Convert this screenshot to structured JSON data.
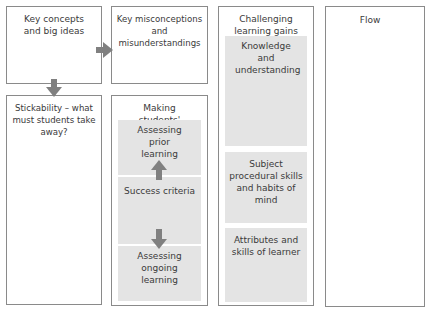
{
  "diagram": {
    "boxes": {
      "key_concepts": {
        "title": "Key concepts and big ideas"
      },
      "key_misconceptions": {
        "title": "Key misconceptions and misunderstandings"
      },
      "challenging_gains": {
        "title": "Challenging learning gains",
        "sections": [
          {
            "label": "Knowledge and understanding"
          },
          {
            "label": "Subject procedural skills and habits of mind"
          },
          {
            "label": "Attributes and skills of learner"
          }
        ]
      },
      "flow": {
        "title": "Flow"
      },
      "stickability": {
        "title": "Stickability – what must students take away?"
      },
      "learning_visible": {
        "title": "Making students' learning visible",
        "sections": [
          {
            "label": "Assessing prior learning"
          },
          {
            "label": "Success criteria"
          },
          {
            "label": "Assessing ongoing learning"
          }
        ]
      }
    },
    "arrows": [
      {
        "from": "key_concepts",
        "to": "key_misconceptions",
        "direction": "right"
      },
      {
        "from": "key_concepts",
        "to": "stickability",
        "direction": "down"
      },
      {
        "from": "success_criteria",
        "to": "assessing_prior_learning",
        "direction": "up"
      },
      {
        "from": "success_criteria",
        "to": "assessing_ongoing_learning",
        "direction": "down"
      }
    ],
    "colors": {
      "border": "#8a8a8a",
      "section_fill": "#e4e4e4",
      "arrow": "#808080",
      "text": "#3a3a3a"
    }
  }
}
